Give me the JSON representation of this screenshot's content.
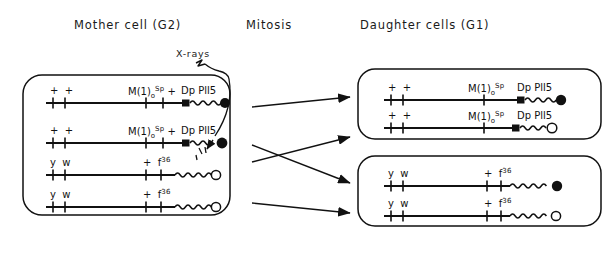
{
  "figure": {
    "headers": {
      "mother": "Mother cell (G2)",
      "mitosis": "Mitosis",
      "daughter": "Daughter cells (G1)"
    },
    "annotation": {
      "xray_label": "X-rays",
      "xray_icon": "lightning-arrow-icon",
      "xray_target": "chromosome-row-2-telomere"
    },
    "legend": {
      "filled_circle": "marked / labelled telomere",
      "open_circle": "unmarked telomere",
      "filled_square": "centromere",
      "wavy_segment": "heterochromatin",
      "tick": "genetic marker locus"
    },
    "mother_cell": {
      "name": "Mother cell (G2)",
      "chromosomes": [
        {
          "id": "m1",
          "left_markers": [
            "+",
            "+"
          ],
          "right_markers": [
            "M(1)o^Sp",
            "+"
          ],
          "right_label_main": "M(1)",
          "right_label_sub": "o",
          "right_label_sup": "Sp",
          "right_label_plus": "+",
          "duplication": "Dp Pll5",
          "has_square": true,
          "terminus": "filled"
        },
        {
          "id": "m2",
          "left_markers": [
            "+",
            "+"
          ],
          "right_markers": [
            "M(1)o^Sp",
            "+"
          ],
          "right_label_main": "M(1)",
          "right_label_sub": "o",
          "right_label_sup": "Sp",
          "right_label_plus": "+",
          "duplication": "Dp Pll5",
          "has_square": true,
          "terminus": "filled",
          "irradiated": true
        },
        {
          "id": "m3",
          "left_markers": [
            "y",
            "w"
          ],
          "right_label_plus": "+",
          "right_label_main": "f",
          "right_label_sup": "36",
          "has_square": false,
          "terminus": "open"
        },
        {
          "id": "m4",
          "left_markers": [
            "y",
            "w"
          ],
          "right_label_plus": "+",
          "right_label_main": "f",
          "right_label_sup": "36",
          "has_square": false,
          "terminus": "open"
        }
      ]
    },
    "daughter_cell_top": {
      "name": "Daughter cell 1",
      "chromosomes": [
        {
          "id": "d1a",
          "left_markers": [
            "+",
            "+"
          ],
          "right_label_main": "M(1)",
          "right_label_sub": "o",
          "right_label_sup": "Sp",
          "duplication": "Dp Pll5",
          "has_square": true,
          "terminus": "filled"
        },
        {
          "id": "d1b",
          "left_markers": [
            "+",
            "+"
          ],
          "right_label_main": "M(1)",
          "right_label_sub": "o",
          "right_label_sup": "Sp",
          "duplication": "Dp Pll5",
          "has_square": true,
          "terminus": "open"
        }
      ]
    },
    "daughter_cell_bottom": {
      "name": "Daughter cell 2",
      "chromosomes": [
        {
          "id": "d2a",
          "left_markers": [
            "y",
            "w"
          ],
          "right_label_plus": "+",
          "right_label_main": "f",
          "right_label_sup": "36",
          "has_square": false,
          "terminus": "filled"
        },
        {
          "id": "d2b",
          "left_markers": [
            "y",
            "w"
          ],
          "right_label_plus": "+",
          "right_label_main": "f",
          "right_label_sup": "36",
          "has_square": false,
          "terminus": "open"
        }
      ]
    },
    "arrows": [
      {
        "id": "a1",
        "from": "m1",
        "to": "daughter_cell_top"
      },
      {
        "id": "a2",
        "from": "m2",
        "to": "daughter_cell_bottom"
      },
      {
        "id": "a3",
        "from": "m3",
        "to": "daughter_cell_top"
      },
      {
        "id": "a4",
        "from": "m4",
        "to": "daughter_cell_bottom"
      }
    ],
    "colors": {
      "ink": "#111111",
      "background": "#ffffff"
    }
  }
}
